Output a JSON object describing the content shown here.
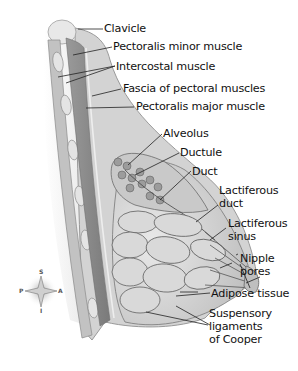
{
  "diagram": {
    "labels": [
      {
        "id": "clavicle",
        "text": "Clavicle"
      },
      {
        "id": "pectoralis-minor",
        "text": "Pectoralis minor muscle"
      },
      {
        "id": "intercostal",
        "text": "Intercostal muscle"
      },
      {
        "id": "fascia",
        "text": "Fascia of pectoral muscles"
      },
      {
        "id": "pectoralis-major",
        "text": "Pectoralis major muscle"
      },
      {
        "id": "alveolus",
        "text": "Alveolus"
      },
      {
        "id": "ductule",
        "text": "Ductule"
      },
      {
        "id": "duct",
        "text": "Duct"
      },
      {
        "id": "lactiferous-duct",
        "text": "Lactiferous\nduct"
      },
      {
        "id": "lactiferous-sinus",
        "text": "Lactiferous\nsinus"
      },
      {
        "id": "nipple-pores",
        "text": "Nipple\npores"
      },
      {
        "id": "adipose",
        "text": "Adipose tissue"
      },
      {
        "id": "suspensory",
        "text": "Suspensory\nligaments\nof Cooper"
      }
    ],
    "compass": {
      "top": "S",
      "bottom": "I",
      "left": "P",
      "right": "A"
    },
    "colors": {
      "muscle": "#8a8a8a",
      "fat": "#c9c9c9",
      "lobule": "#bdbdbd",
      "outline": "#555555",
      "leader": "#222222"
    }
  }
}
